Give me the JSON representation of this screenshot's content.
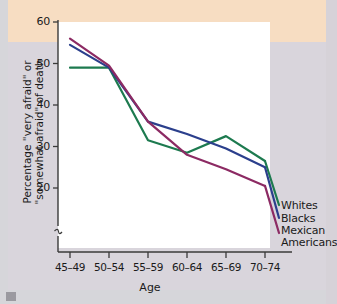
{
  "figure": {
    "background_top_band": "#f7ddc2",
    "background_body": "#d9d5dc",
    "plot_background": "#ffffff"
  },
  "chart_data": {
    "type": "line",
    "title": "",
    "xlabel": "Age",
    "ylabel": "Percentage \"very afraid\" or \"somewhat afraid\" of death",
    "ylabel_line1": "Percentage \"very afraid\" or",
    "ylabel_line2": "\"somewhat afraid\" of death",
    "categories": [
      "45–49",
      "50–54",
      "55–59",
      "60–64",
      "65–69",
      "70–74"
    ],
    "ylim": [
      18,
      60
    ],
    "yticks": [
      20,
      30,
      40,
      50,
      60
    ],
    "ytick_labels": [
      "20",
      "30",
      "40",
      "50",
      "60"
    ],
    "axis_break": true,
    "grid": false,
    "legend_position": "right-inline",
    "series": [
      {
        "name": "Whites",
        "color": "#1d7a4f",
        "values": [
          49,
          49,
          31.5,
          28.5,
          32.5,
          26.5
        ]
      },
      {
        "name": "Blacks",
        "color": "#2b3f8c",
        "values": [
          54.5,
          49,
          36,
          33,
          29.5,
          25
        ]
      },
      {
        "name": "Mexican Americans",
        "color": "#8c2a63",
        "values": [
          56,
          49.5,
          36,
          28,
          24.5,
          20.5
        ]
      }
    ]
  },
  "legend": [
    {
      "label": "Whites",
      "color": "#1d7a4f"
    },
    {
      "label": "Blacks",
      "color": "#2b3f8c"
    },
    {
      "label": "Mexican",
      "label2": "Americans",
      "color": "#8c2a63"
    }
  ]
}
